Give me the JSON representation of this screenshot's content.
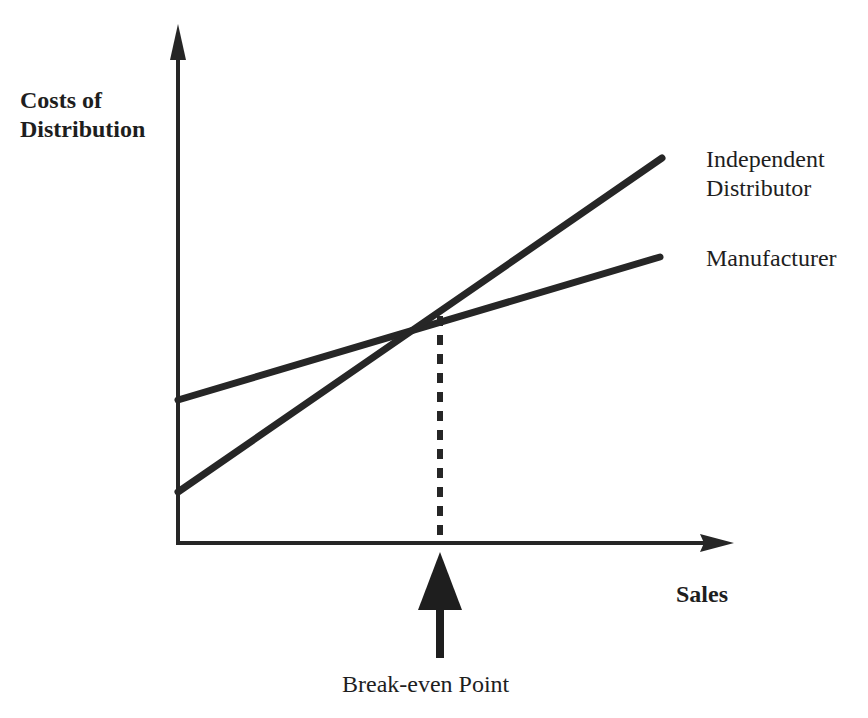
{
  "diagram": {
    "type": "break-even line chart",
    "y_axis_label_line1": "Costs of",
    "y_axis_label_line2": "Distribution",
    "x_axis_label": "Sales",
    "series": [
      {
        "name_line1": "Independent",
        "name_line2": "Distributor",
        "start": [
          178,
          492
        ],
        "end": [
          662,
          158
        ]
      },
      {
        "name": "Manufacturer",
        "start": [
          178,
          400
        ],
        "end": [
          660,
          257
        ]
      }
    ],
    "annotation": "Break-even Point",
    "colors": {
      "line": "#262626",
      "background": "#ffffff"
    }
  }
}
